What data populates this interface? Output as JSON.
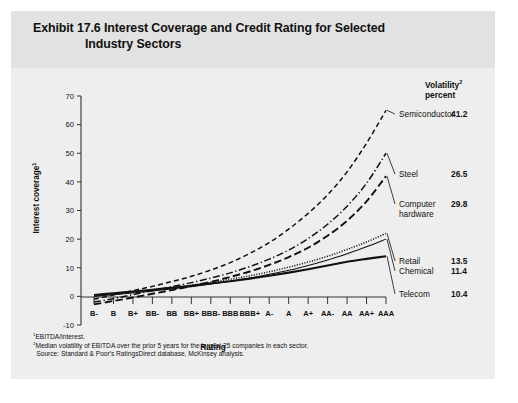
{
  "exhibit": {
    "title_line1": "Exhibit 17.6 Interest Coverage and Credit Rating for Selected",
    "title_line2": "Industry Sectors"
  },
  "volatility_header": {
    "line1": "Volatility",
    "line1_sup": "2",
    "line2": "percent"
  },
  "notes": {
    "note1_sup": "1",
    "note1": "EBITDA/Interest.",
    "note2_sup": "2",
    "note2": "Median volatility of EBITDA over the prior 5 years for the largest 25 companies in each sector.",
    "source": "Source: Standard & Poor's RatingsDirect database, McKinsey analysis."
  },
  "chart_data": {
    "type": "line",
    "title": "Exhibit 17.6 Interest Coverage and Credit Rating for Selected Industry Sectors",
    "xlabel": "Rating",
    "ylabel": "Interest coverage",
    "ylabel_sup": "1",
    "ylim": [
      -10,
      70
    ],
    "yticks": [
      -10,
      0,
      10,
      20,
      30,
      40,
      50,
      60,
      70
    ],
    "ytick_labels": [
      "-10",
      "0",
      "10",
      "20",
      "30",
      "40",
      "50",
      "60",
      "70"
    ],
    "grid": false,
    "legend_position": "right-inline",
    "categories": [
      "B-",
      "B",
      "B+",
      "BB-",
      "BB",
      "BB+",
      "BBB-",
      "BBB",
      "BBB+",
      "A-",
      "A",
      "A+",
      "AA-",
      "AA",
      "AA+",
      "AAA"
    ],
    "series": [
      {
        "name": "Semiconductor",
        "style": "dashed",
        "volatility_percent": "41.2",
        "values": [
          -1.0,
          0.5,
          2.0,
          3.5,
          5.2,
          7.0,
          9.2,
          11.8,
          15.0,
          18.8,
          23.5,
          29.0,
          35.5,
          43.5,
          53.5,
          65.0
        ]
      },
      {
        "name": "Steel",
        "style": "dash-dot",
        "volatility_percent": "26.5",
        "values": [
          -2.0,
          -0.8,
          0.6,
          2.0,
          3.4,
          4.8,
          6.4,
          8.2,
          10.4,
          13.0,
          16.2,
          20.2,
          25.2,
          31.5,
          39.5,
          50.0
        ]
      },
      {
        "name": "Computer hardware",
        "style": "long-dash",
        "volatility_percent": "29.8",
        "values": [
          -2.8,
          -1.6,
          -0.4,
          0.9,
          2.2,
          3.6,
          5.1,
          6.8,
          8.7,
          11.0,
          13.7,
          17.0,
          21.2,
          26.4,
          33.2,
          42.0
        ]
      },
      {
        "name": "Retail",
        "style": "dotted",
        "volatility_percent": "13.5",
        "values": [
          0.2,
          0.8,
          1.5,
          2.2,
          3.0,
          3.9,
          4.9,
          6.0,
          7.2,
          8.6,
          10.2,
          12.0,
          14.0,
          16.4,
          19.0,
          22.0
        ]
      },
      {
        "name": "Chemical",
        "style": "thin-solid",
        "volatility_percent": "11.4",
        "values": [
          0.0,
          0.6,
          1.2,
          1.9,
          2.6,
          3.4,
          4.3,
          5.3,
          6.4,
          7.7,
          9.1,
          10.8,
          12.7,
          14.9,
          17.3,
          20.0
        ]
      },
      {
        "name": "Telecom",
        "style": "thick-solid",
        "volatility_percent": "10.4",
        "values": [
          0.5,
          1.1,
          1.7,
          2.3,
          3.0,
          3.7,
          4.5,
          5.3,
          6.2,
          7.2,
          8.3,
          9.5,
          10.8,
          12.1,
          13.1,
          14.0
        ]
      }
    ]
  }
}
